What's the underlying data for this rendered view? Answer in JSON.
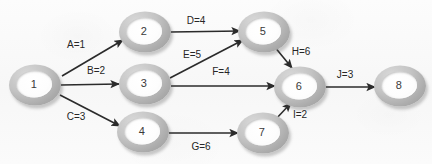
{
  "diagram": {
    "background_color": "#fafafa",
    "node_fill_color": "#ffffff",
    "node_ring_color": "#b0b0b0",
    "edge_color": "#2b2b2b",
    "label_text_color": "#262626",
    "nodes": [
      {
        "id": "1",
        "label": "1",
        "x": 35,
        "y": 85
      },
      {
        "id": "2",
        "label": "2",
        "x": 145,
        "y": 32
      },
      {
        "id": "3",
        "label": "3",
        "x": 145,
        "y": 84
      },
      {
        "id": "4",
        "label": "4",
        "x": 143,
        "y": 132
      },
      {
        "id": "5",
        "label": "5",
        "x": 264,
        "y": 32
      },
      {
        "id": "6",
        "label": "6",
        "x": 300,
        "y": 87
      },
      {
        "id": "7",
        "label": "7",
        "x": 263,
        "y": 133
      },
      {
        "id": "8",
        "label": "8",
        "x": 400,
        "y": 86
      }
    ],
    "edges": [
      {
        "id": "A",
        "from": "1",
        "to": "2",
        "activity": "A",
        "weight": 1,
        "label": "A=1",
        "label_x": 76,
        "label_y": 45,
        "x1": 62,
        "y1": 76,
        "x2": 123,
        "y2": 40
      },
      {
        "id": "B",
        "from": "1",
        "to": "3",
        "activity": "B",
        "weight": 2,
        "label": "B=2",
        "label_x": 96,
        "label_y": 71,
        "x1": 61,
        "y1": 85,
        "x2": 119,
        "y2": 84
      },
      {
        "id": "C",
        "from": "1",
        "to": "4",
        "activity": "C",
        "weight": 3,
        "label": "C=3",
        "label_x": 76,
        "label_y": 117,
        "x1": 60,
        "y1": 95,
        "x2": 120,
        "y2": 126
      },
      {
        "id": "D",
        "from": "2",
        "to": "5",
        "activity": "D",
        "weight": 4,
        "label": "D=4",
        "label_x": 196,
        "label_y": 21,
        "x1": 171,
        "y1": 32,
        "x2": 240,
        "y2": 31
      },
      {
        "id": "E",
        "from": "3",
        "to": "5",
        "activity": "E",
        "weight": 5,
        "label": "E=5",
        "label_x": 192,
        "label_y": 55,
        "x1": 170,
        "y1": 78,
        "x2": 243,
        "y2": 40
      },
      {
        "id": "F",
        "from": "3",
        "to": "6",
        "activity": "F",
        "weight": 4,
        "label": "F=4",
        "label_x": 221,
        "label_y": 72,
        "x1": 171,
        "y1": 86,
        "x2": 275,
        "y2": 86
      },
      {
        "id": "G",
        "from": "4",
        "to": "7",
        "activity": "G",
        "weight": 6,
        "label": "G=6",
        "label_x": 201,
        "label_y": 147,
        "x1": 169,
        "y1": 133,
        "x2": 238,
        "y2": 133
      },
      {
        "id": "H",
        "from": "5",
        "to": "6",
        "activity": "H",
        "weight": 6,
        "label": "H=6",
        "label_x": 301,
        "label_y": 52,
        "x1": 274,
        "y1": 46,
        "x2": 292,
        "y2": 68
      },
      {
        "id": "I",
        "from": "7",
        "to": "6",
        "activity": "I",
        "weight": 2,
        "label": "I=2",
        "label_x": 300,
        "label_y": 115,
        "x1": 275,
        "y1": 120,
        "x2": 291,
        "y2": 103
      },
      {
        "id": "J",
        "from": "6",
        "to": "8",
        "activity": "J",
        "weight": 3,
        "label": "J=3",
        "label_x": 345,
        "label_y": 75,
        "x1": 326,
        "y1": 87,
        "x2": 375,
        "y2": 87
      }
    ]
  }
}
